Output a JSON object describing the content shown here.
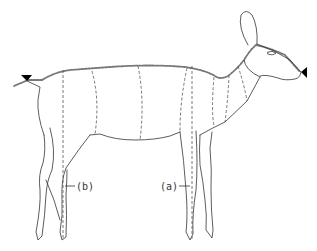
{
  "figure": {
    "labels": [
      {
        "id": "a",
        "text": "(a)"
      },
      {
        "id": "b",
        "text": "(b)"
      }
    ],
    "markers": [
      {
        "id": "tail-marker",
        "shape": "triangle-down"
      },
      {
        "id": "nose-marker",
        "shape": "triangle-left"
      }
    ],
    "colors": {
      "line": "#333333",
      "dashed": "#555555",
      "marker": "#000000",
      "background": "#ffffff"
    }
  }
}
